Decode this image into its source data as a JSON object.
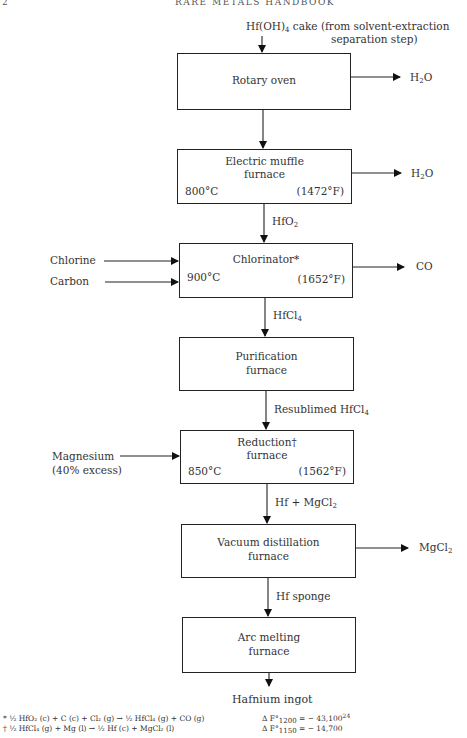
{
  "page": {
    "number": "2",
    "running_head": "RARE METALS HANDBOOK"
  },
  "flowchart": {
    "input_top": {
      "line1_pre": "Hf(OH)",
      "line1_sub": "4",
      "line1_post": " cake (from solvent-extraction",
      "line2": "separation step)"
    },
    "steps": [
      {
        "id": "rotary-oven",
        "title": [
          "Rotary oven"
        ],
        "temp_c": "",
        "temp_f": "",
        "output_pre": "H",
        "output_sub": "2",
        "output_post": "O"
      },
      {
        "id": "electric-muffle-furnace",
        "title": [
          "Electric muffle",
          "furnace"
        ],
        "temp_c": "800°C",
        "temp_f": "(1472°F)",
        "output_pre": "H",
        "output_sub": "2",
        "output_post": "O"
      },
      {
        "id": "chlorinator",
        "title": [
          "Chlorinator*"
        ],
        "temp_c": "900°C",
        "temp_f": "(1652°F)",
        "output_pre": "CO",
        "output_sub": "",
        "output_post": ""
      },
      {
        "id": "purification-furnace",
        "title": [
          "Purification",
          "furnace"
        ],
        "temp_c": "",
        "temp_f": ""
      },
      {
        "id": "reduction-furnace",
        "title": [
          "Reduction†",
          "furnace"
        ],
        "temp_c": "850°C",
        "temp_f": "(1562°F)"
      },
      {
        "id": "vacuum-distillation-furnace",
        "title": [
          "Vacuum distillation",
          "furnace"
        ],
        "temp_c": "",
        "temp_f": "",
        "output_pre": "MgCl",
        "output_sub": "2",
        "output_post": ""
      },
      {
        "id": "arc-melting-furnace",
        "title": [
          "Arc melting",
          "furnace"
        ],
        "temp_c": "",
        "temp_f": ""
      }
    ],
    "intermediates": [
      {
        "pre": "",
        "name": "HfO",
        "sub": "2",
        "post": ""
      },
      {
        "pre": "",
        "name": "HfCl",
        "sub": "4",
        "post": ""
      },
      {
        "pre": "Resublimed ",
        "name": "HfCl",
        "sub": "4",
        "post": ""
      },
      {
        "pre": "Hf + ",
        "name": "MgCl",
        "sub": "2",
        "post": ""
      },
      {
        "pre": "",
        "name": "Hf sponge",
        "sub": "",
        "post": ""
      }
    ],
    "side_inputs": {
      "chlorine": "Chlorine",
      "carbon": "Carbon",
      "magnesium": "Magnesium",
      "magnesium_note": "(40% excess)"
    },
    "final_product": "Hafnium ingot"
  },
  "footnotes": [
    {
      "mark": "*",
      "reaction": "½ HfO₂ (c) + C (c) + Cl₂ (g) → ½ HfCl₄ (g) + CO (g)",
      "delta_label": "Δ F°",
      "delta_sub": "1200",
      "delta_value": "= − 43,100",
      "ref": "24"
    },
    {
      "mark": "†",
      "reaction": "½ HfCl₄ (g) + Mg (l) → ½ Hf (c) + MgCl₂ (l)",
      "delta_label": "Δ F°",
      "delta_sub": "1150",
      "delta_value": "= − 14,700",
      "ref": ""
    }
  ]
}
